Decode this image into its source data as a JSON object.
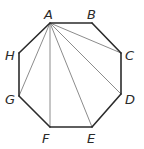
{
  "diagram": {
    "type": "regular-octagon-with-diagonals",
    "colors": {
      "edge": "#2b2b2b",
      "diagonal": "#8c8c8c",
      "label": "#2a2a2a",
      "background": "#ffffff"
    },
    "vertices": [
      {
        "id": "A",
        "x": 50,
        "y": 23,
        "label_x": 44,
        "label_y": 19
      },
      {
        "id": "B",
        "x": 92,
        "y": 23,
        "label_x": 87,
        "label_y": 19
      },
      {
        "id": "C",
        "x": 121,
        "y": 53,
        "label_x": 125,
        "label_y": 60
      },
      {
        "id": "D",
        "x": 121,
        "y": 94,
        "label_x": 125,
        "label_y": 104
      },
      {
        "id": "E",
        "x": 92,
        "y": 127,
        "label_x": 87,
        "label_y": 143
      },
      {
        "id": "F",
        "x": 50,
        "y": 127,
        "label_x": 42,
        "label_y": 143
      },
      {
        "id": "G",
        "x": 19,
        "y": 96,
        "label_x": 5,
        "label_y": 104
      },
      {
        "id": "H",
        "x": 19,
        "y": 53,
        "label_x": 5,
        "label_y": 60
      }
    ],
    "edges": [
      [
        "A",
        "B"
      ],
      [
        "B",
        "C"
      ],
      [
        "C",
        "D"
      ],
      [
        "D",
        "E"
      ],
      [
        "E",
        "F"
      ],
      [
        "F",
        "G"
      ],
      [
        "G",
        "H"
      ],
      [
        "H",
        "A"
      ]
    ],
    "diagonals": [
      [
        "A",
        "C"
      ],
      [
        "A",
        "D"
      ],
      [
        "A",
        "E"
      ],
      [
        "A",
        "F"
      ],
      [
        "A",
        "G"
      ]
    ]
  }
}
